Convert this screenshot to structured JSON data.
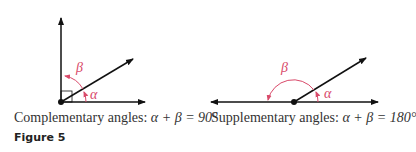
{
  "figure_label": "Figure 5",
  "colors": {
    "line": "#111111",
    "angle": "#d94a6a"
  },
  "diagrams": [
    {
      "name": "complementary",
      "caption_prefix": "Complementary angles: ",
      "caption_math": "α + β = 90°",
      "labels": {
        "alpha": "α",
        "beta": "β"
      },
      "alpha_deg": 30,
      "total_deg": 90
    },
    {
      "name": "supplementary",
      "caption_prefix": "Supplementary angles: ",
      "caption_math": "α + β = 180°",
      "labels": {
        "alpha": "α",
        "beta": "β"
      },
      "alpha_deg": 30,
      "total_deg": 180
    }
  ]
}
